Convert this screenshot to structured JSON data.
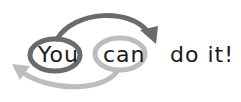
{
  "diagram": {
    "words": {
      "you": "You",
      "can": "can",
      "doit": "do it!"
    },
    "colors": {
      "dark_loop": "#6b6b6b",
      "light_loop": "#bdbdbd",
      "text": "#1a1a1a",
      "background": "#ffffff"
    },
    "arrows": [
      {
        "from": "You",
        "to": "do it!",
        "color": "dark",
        "direction": "forward-over"
      },
      {
        "from": "can",
        "to": "left",
        "color": "light",
        "direction": "back-under"
      }
    ]
  }
}
